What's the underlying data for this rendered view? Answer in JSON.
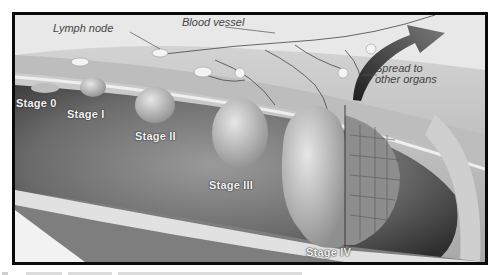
{
  "figure": {
    "callouts": {
      "lymph_node": "Lymph node",
      "blood_vessel": "Blood vessel",
      "spread_line1": "Spread to",
      "spread_line2": "other organs"
    },
    "stages": [
      {
        "label": "Stage 0"
      },
      {
        "label": "Stage I"
      },
      {
        "label": "Stage II"
      },
      {
        "label": "Stage III"
      },
      {
        "label": "Stage IV"
      }
    ],
    "colors": {
      "frame_border": "#0a0a0a",
      "lumen_dark": "#3a3a3a",
      "wall_light": "#d8d8d8",
      "tumor": "#c9c9c9",
      "label_text": "#f4f4f4",
      "callout_text": "#444444"
    }
  }
}
